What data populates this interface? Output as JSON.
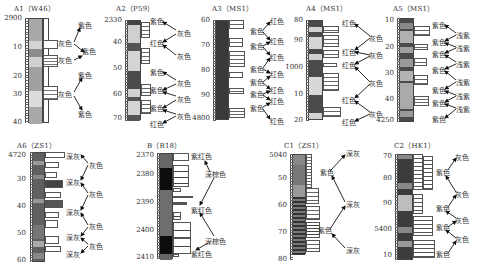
{
  "panels": [
    {
      "id": "A1",
      "title": "A1（W46）",
      "ticks": [
        {
          "label": "2900",
          "y": 18
        },
        {
          "label": "10",
          "y": 47
        },
        {
          "label": "20",
          "y": 76
        },
        {
          "label": "30",
          "y": 94
        },
        {
          "label": "40",
          "y": 122
        }
      ],
      "color_labels": [
        {
          "text": "紫色",
          "x": 78,
          "y": 24
        },
        {
          "text": "灰色",
          "x": 58,
          "y": 42
        },
        {
          "text": "紫色",
          "x": 82,
          "y": 50
        },
        {
          "text": "灰色",
          "x": 58,
          "y": 59
        },
        {
          "text": "紫色",
          "x": 78,
          "y": 74
        },
        {
          "text": "灰色",
          "x": 58,
          "y": 93
        },
        {
          "text": "紫色",
          "x": 78,
          "y": 113
        }
      ]
    },
    {
      "id": "A2",
      "title": "A2（P59）",
      "ticks": [
        {
          "label": "2330",
          "y": 20
        },
        {
          "label": "40",
          "y": 42
        },
        {
          "label": "50",
          "y": 68
        },
        {
          "label": "60",
          "y": 94
        },
        {
          "label": "70",
          "y": 118
        }
      ],
      "color_labels": [
        {
          "text": "紫色",
          "x": 151,
          "y": 20
        },
        {
          "text": "灰色",
          "x": 177,
          "y": 32
        },
        {
          "text": "红色",
          "x": 150,
          "y": 42
        },
        {
          "text": "灰色",
          "x": 177,
          "y": 55
        },
        {
          "text": "紫色",
          "x": 150,
          "y": 71
        },
        {
          "text": "灰色",
          "x": 177,
          "y": 82
        },
        {
          "text": "紫色",
          "x": 150,
          "y": 89
        },
        {
          "text": "灰色",
          "x": 177,
          "y": 98
        },
        {
          "text": "紫色",
          "x": 150,
          "y": 107
        },
        {
          "text": "灰色",
          "x": 177,
          "y": 115
        },
        {
          "text": "红色",
          "x": 150,
          "y": 123
        }
      ]
    },
    {
      "id": "A3",
      "title": "A3（MS1）",
      "ticks": [
        {
          "label": "60",
          "y": 20
        },
        {
          "label": "70",
          "y": 45
        },
        {
          "label": "80",
          "y": 70
        },
        {
          "label": "90",
          "y": 95
        },
        {
          "label": "4800",
          "y": 118
        }
      ],
      "color_labels": [
        {
          "text": "红色",
          "x": 270,
          "y": 20
        },
        {
          "text": "紫色",
          "x": 250,
          "y": 30
        },
        {
          "text": "红色",
          "x": 270,
          "y": 40
        },
        {
          "text": "紫色",
          "x": 250,
          "y": 45
        },
        {
          "text": "红色",
          "x": 270,
          "y": 56
        },
        {
          "text": "紫色",
          "x": 250,
          "y": 68
        },
        {
          "text": "红色",
          "x": 270,
          "y": 73
        },
        {
          "text": "紫色",
          "x": 250,
          "y": 81
        },
        {
          "text": "红色",
          "x": 270,
          "y": 89
        },
        {
          "text": "紫色",
          "x": 250,
          "y": 93
        },
        {
          "text": "红色",
          "x": 270,
          "y": 100
        },
        {
          "text": "紫色",
          "x": 250,
          "y": 107
        },
        {
          "text": "红色",
          "x": 270,
          "y": 120
        }
      ]
    },
    {
      "id": "A4",
      "title": "A4（MS1）",
      "ticks": [
        {
          "label": "80",
          "y": 20
        },
        {
          "label": "90",
          "y": 40
        },
        {
          "label": "1000",
          "y": 67
        },
        {
          "label": "10",
          "y": 94
        },
        {
          "label": "20",
          "y": 120
        }
      ],
      "color_labels": [
        {
          "text": "红色",
          "x": 342,
          "y": 22
        },
        {
          "text": "灰色",
          "x": 369,
          "y": 37
        },
        {
          "text": "红色",
          "x": 342,
          "y": 51
        },
        {
          "text": "灰色",
          "x": 369,
          "y": 54
        },
        {
          "text": "红色",
          "x": 342,
          "y": 64
        },
        {
          "text": "灰色",
          "x": 369,
          "y": 82
        },
        {
          "text": "红色",
          "x": 342,
          "y": 99
        },
        {
          "text": "灰色",
          "x": 369,
          "y": 113
        },
        {
          "text": "红色",
          "x": 342,
          "y": 121
        }
      ]
    },
    {
      "id": "A5",
      "title": "A5（MS1）",
      "ticks": [
        {
          "label": "10",
          "y": 20
        },
        {
          "label": "20",
          "y": 47
        },
        {
          "label": "30",
          "y": 73
        },
        {
          "label": "40",
          "y": 99
        },
        {
          "label": "4250",
          "y": 120
        }
      ],
      "color_labels": [
        {
          "text": "紫色",
          "x": 432,
          "y": 24
        },
        {
          "text": "浅紫",
          "x": 456,
          "y": 34
        },
        {
          "text": "紫色",
          "x": 432,
          "y": 41
        },
        {
          "text": "浅紫",
          "x": 456,
          "y": 47
        },
        {
          "text": "紫色",
          "x": 432,
          "y": 53
        },
        {
          "text": "浅紫",
          "x": 456,
          "y": 63
        },
        {
          "text": "紫色",
          "x": 432,
          "y": 69
        },
        {
          "text": "浅紫",
          "x": 456,
          "y": 81
        },
        {
          "text": "紫色",
          "x": 432,
          "y": 89
        },
        {
          "text": "浅紫",
          "x": 456,
          "y": 95
        },
        {
          "text": "紫色",
          "x": 432,
          "y": 102
        },
        {
          "text": "浅紫",
          "x": 456,
          "y": 108
        },
        {
          "text": "紫色",
          "x": 432,
          "y": 118
        }
      ]
    },
    {
      "id": "A6",
      "title": "A6（ZS1）",
      "ticks": [
        {
          "label": "4720",
          "y": 155
        },
        {
          "label": "30",
          "y": 179
        },
        {
          "label": "40",
          "y": 206
        },
        {
          "label": "50",
          "y": 233
        },
        {
          "label": "60",
          "y": 260
        }
      ],
      "color_labels": [
        {
          "text": "深灰",
          "x": 66,
          "y": 155
        },
        {
          "text": "灰色",
          "x": 89,
          "y": 164
        },
        {
          "text": "深灰",
          "x": 66,
          "y": 181
        },
        {
          "text": "灰色",
          "x": 89,
          "y": 193
        },
        {
          "text": "深灰",
          "x": 66,
          "y": 211
        },
        {
          "text": "灰色",
          "x": 89,
          "y": 225
        },
        {
          "text": "深灰",
          "x": 66,
          "y": 236
        },
        {
          "text": "灰色",
          "x": 89,
          "y": 245
        },
        {
          "text": "深灰",
          "x": 66,
          "y": 253
        }
      ]
    },
    {
      "id": "B",
      "title": "B（B18）",
      "ticks": [
        {
          "label": "2370",
          "y": 155
        },
        {
          "label": "2380",
          "y": 174
        },
        {
          "label": "2390",
          "y": 202
        },
        {
          "label": "2400",
          "y": 230
        },
        {
          "label": "2410",
          "y": 257
        }
      ],
      "color_labels": [
        {
          "text": "紫红色",
          "x": 191,
          "y": 155
        },
        {
          "text": "深棕色",
          "x": 205,
          "y": 173
        },
        {
          "text": "紫红色",
          "x": 191,
          "y": 209
        },
        {
          "text": "深棕色",
          "x": 205,
          "y": 240
        },
        {
          "text": "紫红色",
          "x": 191,
          "y": 253
        }
      ]
    },
    {
      "id": "C1",
      "title": "C1（ZS1）",
      "ticks": [
        {
          "label": "5040",
          "y": 155
        },
        {
          "label": "50",
          "y": 178
        },
        {
          "label": "60",
          "y": 205
        },
        {
          "label": "70",
          "y": 232
        },
        {
          "label": "80",
          "y": 259
        }
      ],
      "color_labels": [
        {
          "text": "深灰",
          "x": 346,
          "y": 152
        },
        {
          "text": "紫色",
          "x": 320,
          "y": 171
        },
        {
          "text": "深灰",
          "x": 346,
          "y": 203
        },
        {
          "text": "紫色",
          "x": 322,
          "y": 229
        },
        {
          "text": "深灰",
          "x": 346,
          "y": 249
        }
      ]
    },
    {
      "id": "C2",
      "title": "C2（HK1）",
      "ticks": [
        {
          "label": "70",
          "y": 156
        },
        {
          "label": "80",
          "y": 178
        },
        {
          "label": "90",
          "y": 203
        },
        {
          "label": "5400",
          "y": 229
        },
        {
          "label": "10",
          "y": 255
        }
      ],
      "color_labels": [
        {
          "text": "灰色",
          "x": 455,
          "y": 156
        },
        {
          "text": "紫色",
          "x": 437,
          "y": 171
        },
        {
          "text": "灰色",
          "x": 455,
          "y": 193
        },
        {
          "text": "紫色",
          "x": 437,
          "y": 207
        },
        {
          "text": "灰色",
          "x": 455,
          "y": 219
        },
        {
          "text": "紫色",
          "x": 437,
          "y": 226
        },
        {
          "text": "灰色",
          "x": 455,
          "y": 238
        },
        {
          "text": "紫色",
          "x": 437,
          "y": 253
        }
      ]
    }
  ],
  "colors": {
    "light_gray": "#c8c8c8",
    "mid_gray": "#9a9a9a",
    "dark_gray": "#5a5a5a",
    "black": "#111111",
    "axis": "#444444"
  }
}
